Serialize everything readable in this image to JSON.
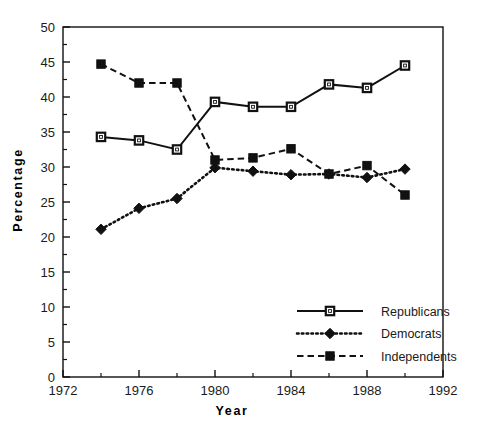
{
  "chart_data": {
    "type": "line",
    "title": "",
    "xlabel": "Year",
    "ylabel": "Percentage",
    "xlim": [
      1972,
      1992
    ],
    "ylim": [
      0,
      50
    ],
    "grid": false,
    "legend_position": "inside-lower-right",
    "x": [
      1974,
      1976,
      1978,
      1980,
      1982,
      1984,
      1986,
      1988,
      1990
    ],
    "xticks": [
      1972,
      1976,
      1980,
      1984,
      1988,
      1992
    ],
    "xticks_minor": [
      1974,
      1978,
      1982,
      1986,
      1990
    ],
    "yticks": [
      0,
      5,
      10,
      15,
      20,
      25,
      30,
      35,
      40,
      45,
      50
    ],
    "yticks_minor": [
      2.5,
      7.5,
      12.5,
      17.5,
      22.5,
      27.5,
      32.5,
      37.5,
      42.5,
      47.5
    ],
    "series": [
      {
        "name": "Republicans",
        "marker": "open-square",
        "line": "solid",
        "values": [
          34.3,
          33.8,
          32.5,
          39.3,
          38.6,
          38.6,
          41.8,
          41.3,
          44.5
        ]
      },
      {
        "name": "Democrats",
        "marker": "filled-diamond",
        "line": "dotted",
        "values": [
          21.1,
          24.1,
          25.5,
          29.9,
          29.4,
          28.9,
          29.0,
          28.5,
          29.7
        ]
      },
      {
        "name": "Independents",
        "marker": "filled-square",
        "line": "dashed",
        "values": [
          44.7,
          42.0,
          42.0,
          31.0,
          31.3,
          32.6,
          29.0,
          30.2,
          26.0
        ]
      }
    ]
  },
  "axes": {
    "x_title": "Year",
    "y_title": "Percentage",
    "xtick_labels": [
      "1972",
      "1976",
      "1980",
      "1984",
      "1988",
      "1992"
    ],
    "ytick_labels": [
      "0",
      "5",
      "10",
      "15",
      "20",
      "25",
      "30",
      "35",
      "40",
      "45",
      "50"
    ]
  },
  "legend": {
    "entries": [
      {
        "label": "Republicans"
      },
      {
        "label": "Democrats"
      },
      {
        "label": "Independents"
      }
    ]
  },
  "colors": {
    "line": "#111111",
    "axis": "#111111",
    "text": "#1a1a1a",
    "background": "#ffffff"
  }
}
